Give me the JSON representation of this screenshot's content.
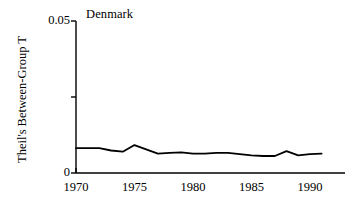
{
  "chart_data": {
    "type": "line",
    "title": "Denmark",
    "xlabel": "",
    "ylabel": "Theil's Between-Group T",
    "xlim": [
      1970,
      1993.0
    ],
    "ylim": [
      0,
      0.05
    ],
    "grid": false,
    "legend": "none",
    "y_ticks": [
      {
        "value": 0.05,
        "label": "0.05",
        "labeled": true
      },
      {
        "value": 0.025,
        "label": "",
        "labeled": false
      },
      {
        "value": 0,
        "label": "0",
        "labeled": true
      }
    ],
    "x_ticks": [
      {
        "value": 1970,
        "label": "1970"
      },
      {
        "value": 1975,
        "label": "1975"
      },
      {
        "value": 1980,
        "label": "1980"
      },
      {
        "value": 1985,
        "label": "1985"
      },
      {
        "value": 1990,
        "label": "1990"
      }
    ],
    "series": [
      {
        "name": "Denmark",
        "color": "#000000",
        "x": [
          1970,
          1971,
          1972,
          1973,
          1974,
          1975,
          1976,
          1977,
          1978,
          1979,
          1980,
          1981,
          1982,
          1983,
          1984,
          1985,
          1986,
          1987,
          1988,
          1989,
          1990,
          1991
        ],
        "values": [
          0.0082,
          0.0082,
          0.0082,
          0.0074,
          0.007,
          0.0092,
          0.0078,
          0.0064,
          0.0066,
          0.0068,
          0.0064,
          0.0064,
          0.0066,
          0.0066,
          0.0062,
          0.0058,
          0.0056,
          0.0056,
          0.0072,
          0.0058,
          0.0062,
          0.0064
        ]
      }
    ]
  }
}
